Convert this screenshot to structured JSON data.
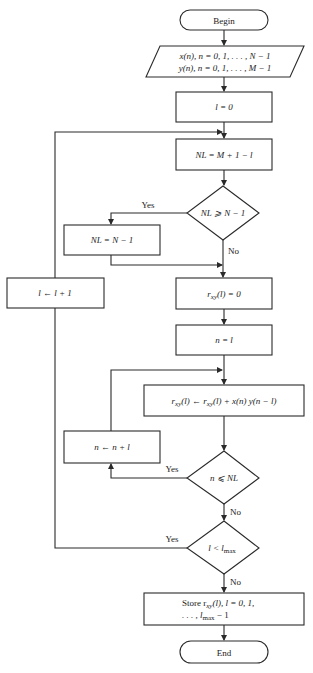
{
  "flowchart": {
    "begin": "Begin",
    "end": "End",
    "input": {
      "line1": "x(n), n = 0, 1, . . . , N − 1",
      "line2": "y(n), n = 0, 1, . . . , M − 1"
    },
    "init_l": "l = 0",
    "set_nl": "NL = M + 1 − l",
    "decision_nl": "NL ⩾ N − 1",
    "clip_nl": "NL = N − 1",
    "increment_l": "l ← l + 1",
    "init_r": {
      "main": "r",
      "sub": "xy",
      "rest": "(l) = 0"
    },
    "init_n": "n = l",
    "accumulate": {
      "a": "r",
      "a_sub": "xy",
      "b": "(l) ← r",
      "b_sub": "xy",
      "c": "(l) + x(n) y(n − l)"
    },
    "increment_n": "n ← n + l",
    "decision_n": "n ⩽ NL",
    "decision_l": {
      "main": "l < l",
      "sub": "max"
    },
    "store": {
      "line1_a": "Store r",
      "line1_sub": "xy",
      "line1_b": "(l), l = 0, 1,",
      "line2_a": ". . . , l",
      "line2_sub": "max",
      "line2_b": " − 1"
    },
    "labels": {
      "yes": "Yes",
      "no": "No"
    }
  },
  "colors": {
    "stroke": "#2a2a2a",
    "background": "#ffffff"
  }
}
